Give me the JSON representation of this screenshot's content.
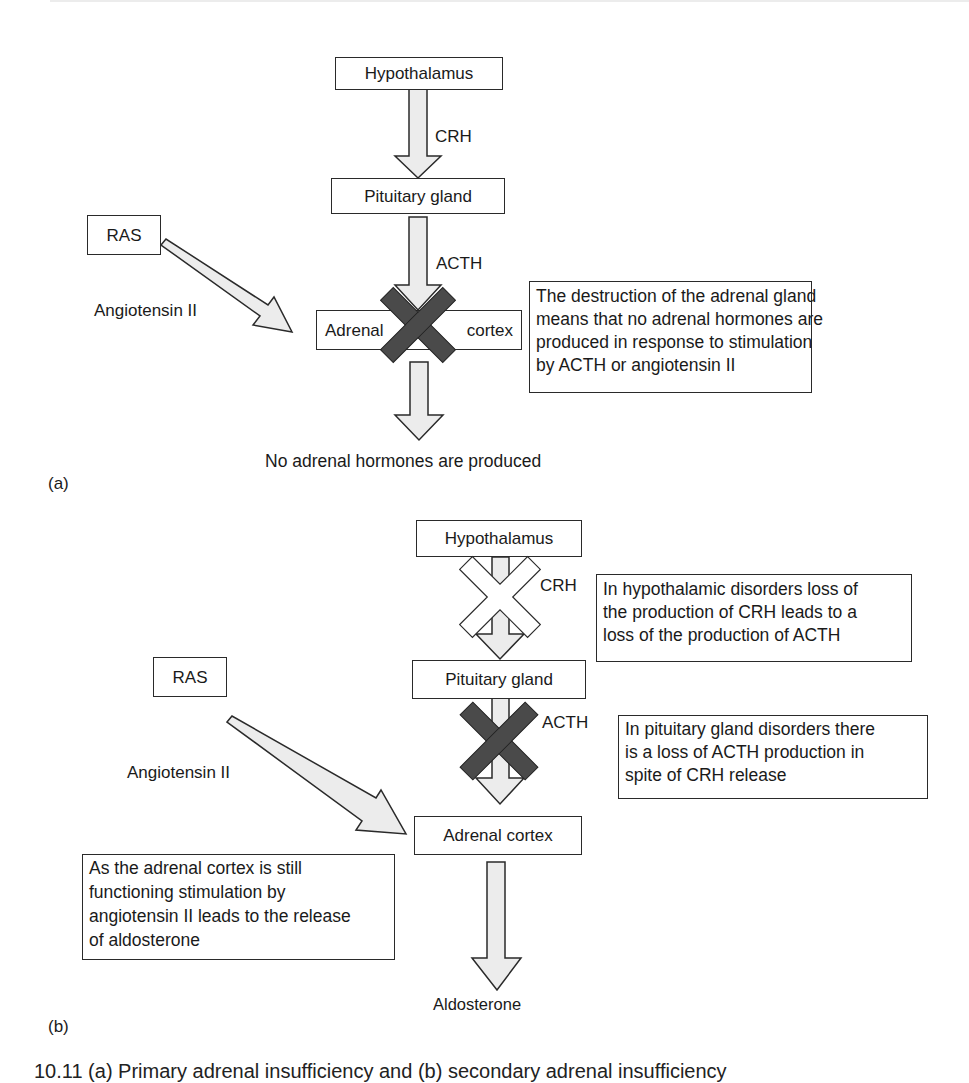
{
  "figure": {
    "panel_a": {
      "label": "(a)",
      "nodes": {
        "hypothalamus": "Hypothalamus",
        "pituitary": "Pituitary gland",
        "ras": "RAS",
        "adrenal_left": "Adrenal",
        "adrenal_right": "cortex"
      },
      "arrows": {
        "crh": "CRH",
        "acth": "ACTH",
        "angiotensin": "Angiotensin II"
      },
      "outcome": "No adrenal hormones are produced",
      "note_lines": [
        "The destruction of the adrenal gland",
        "means that no adrenal hormones are",
        "produced in response to stimulation",
        "by ACTH or angiotensin II"
      ],
      "blocks": [
        {
          "location": "adrenal cortex",
          "style": "dark-x"
        }
      ]
    },
    "panel_b": {
      "label": "(b)",
      "nodes": {
        "hypothalamus": "Hypothalamus",
        "pituitary": "Pituitary gland",
        "ras": "RAS",
        "adrenal": "Adrenal cortex"
      },
      "arrows": {
        "crh": "CRH",
        "acth": "ACTH",
        "angiotensin": "Angiotensin II"
      },
      "outcome": "Aldosterone",
      "note_hypothalamic_lines": [
        "In hypothalamic disorders loss of",
        "the production of CRH leads to a",
        "loss of the production of ACTH"
      ],
      "note_pituitary_lines": [
        "In pituitary gland disorders there",
        "is a loss of ACTH production in",
        "spite of CRH release"
      ],
      "note_adrenal_lines": [
        "As the adrenal cortex is still",
        "functioning stimulation by",
        "angiotensin II leads to the release",
        "of aldosterone"
      ],
      "blocks": [
        {
          "location": "CRH arrow",
          "style": "outline-x"
        },
        {
          "location": "ACTH arrow",
          "style": "dark-x"
        }
      ]
    },
    "caption_partial": "10.11 (a) Primary adrenal insufficiency and (b) secondary adrenal insufficiency",
    "colors": {
      "arrow_fill": "#ececec",
      "stroke": "#2a2a2a",
      "dark_x": "#4a4a4a",
      "outline_x_fill": "#ffffff"
    }
  }
}
